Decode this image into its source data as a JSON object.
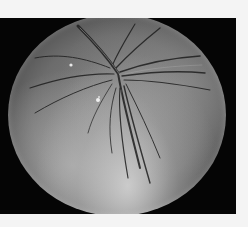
{
  "image": {
    "description": "Grayscale scanning electron micrograph of a spherical specimen with radiating folds converging near the top center",
    "background_color": "#050505",
    "page_background": "#f4f4f4",
    "specimen_tone_light": "#d7d7d7",
    "specimen_tone_dark": "#3e3e3e"
  }
}
